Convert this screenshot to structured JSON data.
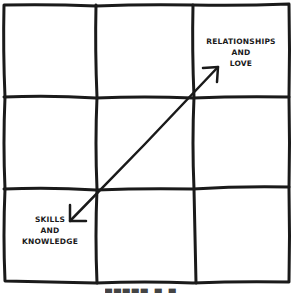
{
  "diagram": {
    "type": "3x3 grid with diagonal double-headed arrow",
    "grid": {
      "rows": 3,
      "cols": 3
    },
    "labels": {
      "top_right": [
        "RELATIONSHIPS",
        "AND",
        "LOVE"
      ],
      "bottom_left": [
        "SKILLS",
        "AND",
        "KNOWLEDGE"
      ]
    },
    "arrow": {
      "from": "bottom-left (Skills and Knowledge)",
      "to": "top-right (Relationships and Love)",
      "double_headed": true
    },
    "caption_partial": "▀▀▀▀▀ ▀ ▀",
    "colors": {
      "line": "#1a1a1a",
      "background": "#ffffff"
    }
  }
}
